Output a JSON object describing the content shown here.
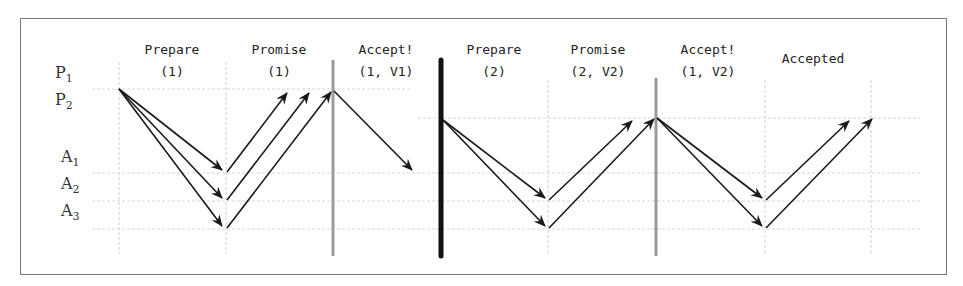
{
  "diagram": {
    "row_labels": [
      {
        "id": "P1",
        "base": "P",
        "sub": "1"
      },
      {
        "id": "P2",
        "base": "P",
        "sub": "2"
      },
      {
        "id": "A1",
        "base": "A",
        "sub": "1"
      },
      {
        "id": "A2",
        "base": "A",
        "sub": "2"
      },
      {
        "id": "A3",
        "base": "A",
        "sub": "3"
      }
    ],
    "phases": [
      {
        "line1": "Prepare",
        "line2": "(1)"
      },
      {
        "line1": "Promise",
        "line2": "(1)"
      },
      {
        "line1": "Accept!",
        "line2": "(1, V1)"
      },
      {
        "line1": "Prepare",
        "line2": "(2)"
      },
      {
        "line1": "Promise",
        "line2": "(2, V2)"
      },
      {
        "line1": "Accept!",
        "line2": "(1, V2)"
      },
      {
        "line1": "Accepted",
        "line2": ""
      }
    ],
    "colors": {
      "arrow": "#1a1a1a",
      "grid": "#c8c8c8",
      "separator_gray": "#9a9a9a",
      "separator_black": "#111111",
      "border": "#7a7a7a"
    }
  }
}
